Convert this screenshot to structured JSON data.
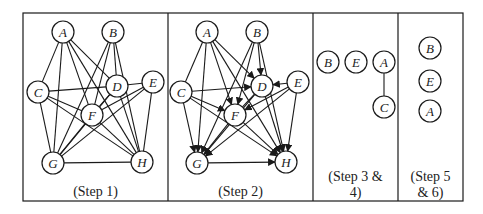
{
  "colors": {
    "stroke": "#1a1a1a",
    "background": "#ffffff",
    "text": "#222222"
  },
  "panels": [
    {
      "id": "step1",
      "caption": [
        "(Step 1)"
      ],
      "x": 23,
      "w": 145,
      "nodes": [
        {
          "id": "A",
          "x": 63,
          "y": 32
        },
        {
          "id": "B",
          "x": 113,
          "y": 32
        },
        {
          "id": "C",
          "x": 38,
          "y": 92
        },
        {
          "id": "D",
          "x": 117,
          "y": 86
        },
        {
          "id": "E",
          "x": 153,
          "y": 82
        },
        {
          "id": "F",
          "x": 92,
          "y": 115
        },
        {
          "id": "G",
          "x": 53,
          "y": 163
        },
        {
          "id": "H",
          "x": 142,
          "y": 162
        }
      ],
      "edges": [
        [
          "A",
          "C",
          0
        ],
        [
          "A",
          "G",
          0
        ],
        [
          "A",
          "F",
          0
        ],
        [
          "A",
          "D",
          0
        ],
        [
          "A",
          "H",
          0
        ],
        [
          "B",
          "D",
          0
        ],
        [
          "B",
          "F",
          0
        ],
        [
          "B",
          "G",
          0
        ],
        [
          "B",
          "H",
          0
        ],
        [
          "C",
          "D",
          0
        ],
        [
          "C",
          "F",
          0
        ],
        [
          "C",
          "G",
          0
        ],
        [
          "C",
          "H",
          0
        ],
        [
          "D",
          "E",
          0
        ],
        [
          "D",
          "F",
          0
        ],
        [
          "D",
          "H",
          0
        ],
        [
          "D",
          "G",
          0
        ],
        [
          "E",
          "F",
          0
        ],
        [
          "E",
          "G",
          0
        ],
        [
          "E",
          "H",
          0
        ],
        [
          "F",
          "G",
          0
        ],
        [
          "F",
          "H",
          0
        ],
        [
          "G",
          "H",
          0
        ]
      ]
    },
    {
      "id": "step2",
      "caption": [
        "(Step 2)"
      ],
      "x": 168,
      "w": 145,
      "nodes": [
        {
          "id": "A",
          "x": 207,
          "y": 32
        },
        {
          "id": "B",
          "x": 257,
          "y": 32
        },
        {
          "id": "C",
          "x": 181,
          "y": 92
        },
        {
          "id": "D",
          "x": 262,
          "y": 86
        },
        {
          "id": "E",
          "x": 298,
          "y": 82
        },
        {
          "id": "F",
          "x": 235,
          "y": 115
        },
        {
          "id": "G",
          "x": 197,
          "y": 163
        },
        {
          "id": "H",
          "x": 286,
          "y": 162
        }
      ],
      "edges": [
        [
          "A",
          "C",
          0
        ],
        [
          "A",
          "G",
          1
        ],
        [
          "A",
          "F",
          1
        ],
        [
          "A",
          "D",
          1
        ],
        [
          "A",
          "H",
          1
        ],
        [
          "B",
          "D",
          1
        ],
        [
          "B",
          "F",
          1
        ],
        [
          "B",
          "G",
          1
        ],
        [
          "B",
          "H",
          1
        ],
        [
          "C",
          "D",
          1
        ],
        [
          "C",
          "F",
          1
        ],
        [
          "C",
          "G",
          1
        ],
        [
          "C",
          "H",
          1
        ],
        [
          "E",
          "D",
          1
        ],
        [
          "D",
          "F",
          0
        ],
        [
          "D",
          "H",
          1
        ],
        [
          "D",
          "G",
          1
        ],
        [
          "E",
          "F",
          1
        ],
        [
          "E",
          "G",
          1
        ],
        [
          "E",
          "H",
          1
        ],
        [
          "F",
          "G",
          0
        ],
        [
          "F",
          "H",
          1
        ],
        [
          "G",
          "H",
          1
        ]
      ]
    },
    {
      "id": "step34",
      "caption": [
        "(Step 3 &",
        "4)"
      ],
      "x": 313,
      "w": 85,
      "nodes": [
        {
          "id": "B",
          "x": 328,
          "y": 62
        },
        {
          "id": "E",
          "x": 356,
          "y": 62
        },
        {
          "id": "A",
          "x": 384,
          "y": 62
        },
        {
          "id": "C",
          "x": 384,
          "y": 107
        }
      ],
      "edges": [
        [
          "A",
          "C",
          0
        ]
      ]
    },
    {
      "id": "step56",
      "caption": [
        "(Step 5",
        "& 6)"
      ],
      "x": 398,
      "w": 65,
      "nodes": [
        {
          "id": "B",
          "x": 430,
          "y": 48
        },
        {
          "id": "E",
          "x": 430,
          "y": 81
        },
        {
          "id": "A",
          "x": 430,
          "y": 111
        }
      ],
      "edges": []
    }
  ],
  "frame": {
    "top": 13,
    "bottom": 201,
    "left": 23,
    "right": 463
  },
  "node_radius": 11
}
